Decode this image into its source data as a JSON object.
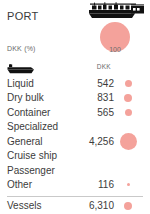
{
  "header": {
    "title": "PORT",
    "vessel_icon": "cargo-vessel-icon",
    "unit_label": "DKK (%)",
    "hero": {
      "value": "100",
      "bubble_color": "#F4A29B"
    }
  },
  "table": {
    "icon": "cargo-boat-icon",
    "value_column_header": "DKK",
    "rows": [
      {
        "label": "Liquid",
        "value": "542",
        "bubble_px": 7
      },
      {
        "label": "Dry bulk",
        "value": "831",
        "bubble_px": 8
      },
      {
        "label": "Container",
        "value": "565",
        "bubble_px": 7
      },
      {
        "label": "Specialized",
        "value": "",
        "bubble_px": 0
      },
      {
        "label": "General",
        "value": "4,256",
        "bubble_px": 17
      },
      {
        "label": "Cruise ship",
        "value": "",
        "bubble_px": 0
      },
      {
        "label": "Passenger",
        "value": "",
        "bubble_px": 0
      },
      {
        "label": "Other",
        "value": "116",
        "bubble_px": 3
      }
    ]
  },
  "total": {
    "label": "Vessels",
    "value": "6,310",
    "bubble_px": 8
  },
  "chart_data": {
    "type": "table",
    "title": "PORT",
    "unit": "DKK (%)",
    "categories": [
      "Liquid",
      "Dry bulk",
      "Container",
      "Specialized",
      "General",
      "Cruise ship",
      "Passenger",
      "Other"
    ],
    "values": [
      542,
      831,
      565,
      null,
      4256,
      null,
      null,
      116
    ],
    "total_label": "Vessels",
    "total_value": 6310,
    "reference_value": 100,
    "series_color": "#F4A29B",
    "encoding": "bubble-size-by-value"
  }
}
